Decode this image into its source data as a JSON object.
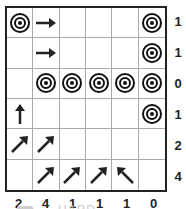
{
  "puzzle": {
    "difficulty_label": "HARD",
    "rows": 6,
    "cols": 6,
    "cells": [
      [
        "target",
        "arrow-right",
        "",
        "",
        "",
        "target"
      ],
      [
        "",
        "arrow-right",
        "",
        "",
        "",
        "target"
      ],
      [
        "",
        "target",
        "target",
        "target",
        "target",
        "target"
      ],
      [
        "arrow-up",
        "",
        "",
        "",
        "",
        "target"
      ],
      [
        "arrow-up-right",
        "arrow-up-right",
        "",
        "",
        "",
        ""
      ],
      [
        "",
        "arrow-up-right",
        "arrow-up-right",
        "arrow-up-right",
        "arrow-up-left",
        ""
      ]
    ],
    "row_clues": [
      "1",
      "1",
      "0",
      "1",
      "2",
      "4"
    ],
    "col_clues": [
      "2",
      "4",
      "1",
      "1",
      "1",
      "0"
    ]
  },
  "colors": {
    "ink": "#222222",
    "grid_line": "#aaaaaa",
    "footer_gray": "#cccccc"
  }
}
